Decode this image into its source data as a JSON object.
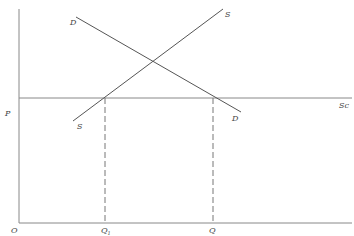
{
  "diagram": {
    "type": "supply-demand-with-competitive-supply",
    "colors": {
      "line": "#555555",
      "axis": "#888888",
      "dashed": "#777777",
      "label": "#444444"
    },
    "axes": {
      "origin_label": "O",
      "y_tick_label": "P",
      "x_tick_labels": {
        "q1_main": "Q",
        "q1_sub": "1",
        "q": "Q"
      }
    },
    "curves": {
      "demand": {
        "label_top": "D",
        "label_bottom": "D"
      },
      "supply": {
        "label_top": "S",
        "label_bottom": "S"
      },
      "competitive_supply": {
        "label": "Sc"
      }
    }
  }
}
